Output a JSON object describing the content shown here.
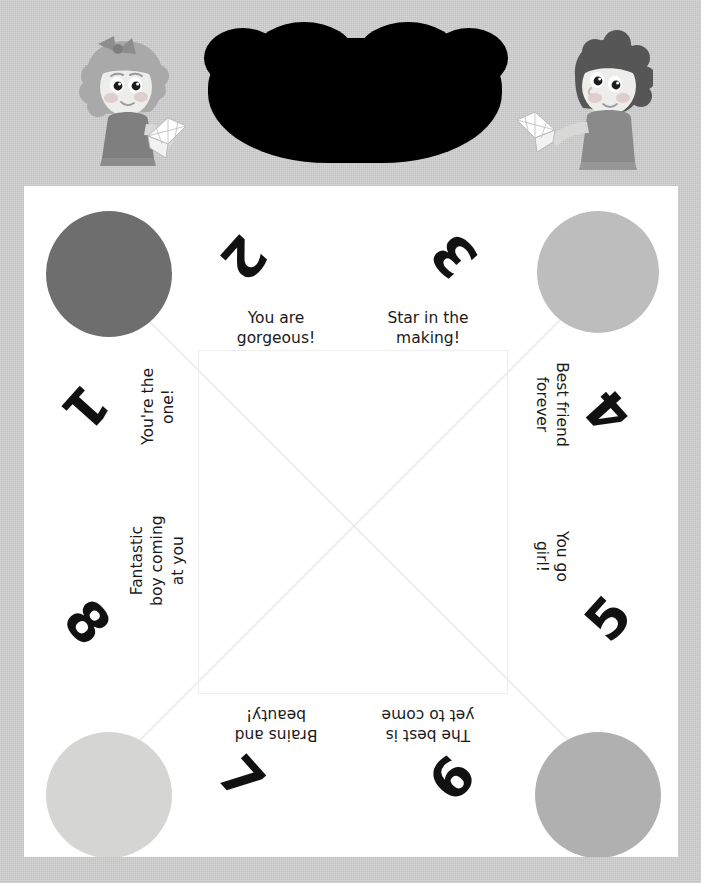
{
  "page": {
    "background_color": "#cecece",
    "sheet_color": "#ffffff",
    "fold_line_color": "#ededee"
  },
  "header": {
    "redacted_title": "",
    "left_character": "girl-with-fortune-teller",
    "right_character": "boy-with-fortune-teller"
  },
  "fortune_teller": {
    "circles": [
      {
        "position": "top-left",
        "color": "#6e6e6e"
      },
      {
        "position": "top-right",
        "color": "#bdbdbd"
      },
      {
        "position": "bottom-left",
        "color": "#d5d5d3"
      },
      {
        "position": "bottom-right",
        "color": "#b0b0b0"
      }
    ],
    "numbers": [
      {
        "value": "1",
        "position": "left-upper"
      },
      {
        "value": "2",
        "position": "top-left"
      },
      {
        "value": "3",
        "position": "top-right"
      },
      {
        "value": "4",
        "position": "right-upper"
      },
      {
        "value": "5",
        "position": "right-lower"
      },
      {
        "value": "6",
        "position": "bottom-right"
      },
      {
        "value": "7",
        "position": "bottom-left"
      },
      {
        "value": "8",
        "position": "left-lower"
      }
    ],
    "fortunes": [
      {
        "number": "1",
        "text": "You're the\none!",
        "position": "left-upper"
      },
      {
        "number": "2",
        "text": "You are\ngorgeous!",
        "position": "top-left"
      },
      {
        "number": "3",
        "text": "Star in the\nmaking!",
        "position": "top-right"
      },
      {
        "number": "4",
        "text": "Best friend\nforever",
        "position": "right-upper"
      },
      {
        "number": "5",
        "text": "You go\ngirl!",
        "position": "right-lower"
      },
      {
        "number": "6",
        "text": "The best is\nyet to come",
        "position": "bottom-right"
      },
      {
        "number": "7",
        "text": "Brains and\nbeauty!",
        "position": "bottom-left"
      },
      {
        "number": "8",
        "text": "Fantastic\nboy coming\nat you",
        "position": "left-lower"
      }
    ]
  }
}
